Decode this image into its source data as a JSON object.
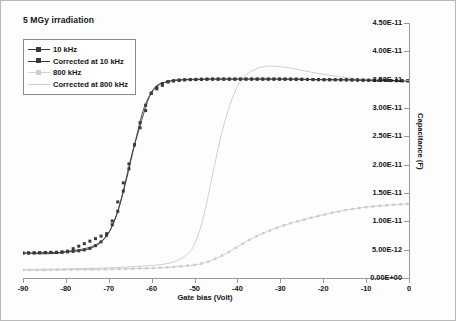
{
  "chart_data": {
    "type": "line",
    "title": "5 MGy irradiation",
    "xlabel": "Gate bias (Volt)",
    "ylabel": "Capacitance (F)",
    "xlim": [
      -90,
      0
    ],
    "ylim": [
      0,
      4.5e-11
    ],
    "xticks": [
      -90,
      -80,
      -70,
      -60,
      -50,
      -40,
      -30,
      -20,
      -10,
      0
    ],
    "xtick_labels": [
      "-90",
      "-80",
      "-70",
      "-60",
      "-50",
      "-40",
      "-30",
      "-20",
      "-10",
      "0"
    ],
    "yticks": [
      0,
      5e-12,
      1e-11,
      1.5e-11,
      2e-11,
      2.5e-11,
      3e-11,
      3.5e-11,
      4e-11,
      4.5e-11
    ],
    "ytick_labels": [
      "0.00E+00",
      "5.00E-12",
      "1.00E-11",
      "1.50E-11",
      "2.00E-11",
      "2.50E-11",
      "3.00E-11",
      "3.50E-11",
      "4.00E-11",
      "4.50E-11"
    ],
    "grid": false,
    "legend_position": "top-left",
    "series": [
      {
        "name": "10 kHz",
        "color": "#3a3a3a",
        "marker": "square",
        "x": [
          -90,
          -88,
          -86,
          -84,
          -82,
          -80,
          -78,
          -76,
          -74,
          -72,
          -70,
          -68,
          -66,
          -64,
          -62,
          -60,
          -58,
          -56,
          -54,
          -52,
          -50,
          -46,
          -42,
          -38,
          -34,
          -30,
          -26,
          -22,
          -18,
          -14,
          -10,
          -6,
          -2,
          0
        ],
        "y": [
          4.4e-12,
          4.4e-12,
          4.45e-12,
          4.5e-12,
          4.5e-12,
          4.6e-12,
          4.7e-12,
          4.9e-12,
          5.3e-12,
          6.2e-12,
          8e-12,
          1.15e-11,
          1.7e-11,
          2.35e-11,
          2.95e-11,
          3.28e-11,
          3.42e-11,
          3.47e-11,
          3.49e-11,
          3.5e-11,
          3.5e-11,
          3.51e-11,
          3.51e-11,
          3.51e-11,
          3.51e-11,
          3.51e-11,
          3.51e-11,
          3.5e-11,
          3.5e-11,
          3.5e-11,
          3.49e-11,
          3.49e-11,
          3.48e-11,
          3.48e-11
        ]
      },
      {
        "name": "Corrected at 10 kHz",
        "color": "#3a3a3a",
        "marker": "square",
        "x": [
          -90,
          -80,
          -70,
          -64,
          -60,
          -56,
          -52,
          -48,
          -40,
          -30,
          -20,
          -10,
          0
        ],
        "y": [
          4.4e-12,
          4.6e-12,
          8e-12,
          2.35e-11,
          3.28e-11,
          3.47e-11,
          3.5e-11,
          3.51e-11,
          3.51e-11,
          3.51e-11,
          3.5e-11,
          3.49e-11,
          3.48e-11
        ]
      },
      {
        "name": "800 kHz",
        "color": "#c9c9c9",
        "marker": "dot",
        "x": [
          -90,
          -86,
          -82,
          -78,
          -74,
          -70,
          -66,
          -62,
          -58,
          -54,
          -50,
          -48,
          -46,
          -44,
          -42,
          -40,
          -38,
          -36,
          -34,
          -30,
          -26,
          -22,
          -18,
          -14,
          -10,
          -6,
          -2,
          0
        ],
        "y": [
          1.4e-12,
          1.4e-12,
          1.45e-12,
          1.5e-12,
          1.5e-12,
          1.55e-12,
          1.6e-12,
          1.7e-12,
          1.8e-12,
          2e-12,
          2.3e-12,
          2.6e-12,
          3.1e-12,
          3.8e-12,
          4.6e-12,
          5.5e-12,
          6.4e-12,
          7.2e-12,
          7.9e-12,
          9.1e-12,
          1e-11,
          1.08e-11,
          1.15e-11,
          1.21e-11,
          1.25e-11,
          1.28e-11,
          1.3e-11,
          1.31e-11
        ]
      },
      {
        "name": "Corrected at 800 kHz",
        "color": "#c9c9c9",
        "marker": "none",
        "x": [
          -90,
          -80,
          -70,
          -62,
          -56,
          -52,
          -50,
          -48,
          -46,
          -44,
          -42,
          -40,
          -38,
          -36,
          -34,
          -32,
          -30,
          -28,
          -26,
          -22,
          -18,
          -14,
          -10,
          -6,
          -2,
          0
        ],
        "y": [
          1.5e-12,
          1.6e-12,
          1.8e-12,
          2.1e-12,
          2.6e-12,
          4e-12,
          6e-12,
          1.05e-11,
          1.75e-11,
          2.45e-11,
          3e-11,
          3.38e-11,
          3.58e-11,
          3.68e-11,
          3.73e-11,
          3.74e-11,
          3.73e-11,
          3.71e-11,
          3.68e-11,
          3.62e-11,
          3.57e-11,
          3.53e-11,
          3.5e-11,
          3.48e-11,
          3.47e-11,
          3.47e-11
        ]
      }
    ]
  },
  "legend": {
    "items": [
      {
        "label": "10 kHz"
      },
      {
        "label": "Corrected at 10 kHz"
      },
      {
        "label": "800 kHz"
      },
      {
        "label": "Corrected at 800 kHz"
      }
    ]
  }
}
